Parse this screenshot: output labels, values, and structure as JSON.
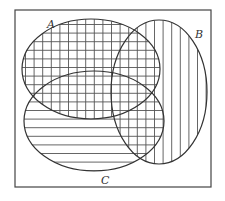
{
  "diagram": {
    "type": "venn",
    "sets": [
      {
        "name": "A",
        "label": "A",
        "fill_pattern": "grid (vertical + horizontal hatching)",
        "label_pos": [
          47,
          28
        ]
      },
      {
        "name": "B",
        "label": "B",
        "fill_pattern": "vertical hatching",
        "label_pos": [
          195,
          38
        ]
      },
      {
        "name": "C",
        "label": "C",
        "fill_pattern": "horizontal hatching",
        "label_pos": [
          101,
          184
        ]
      }
    ],
    "colors": {
      "background": "#ffffff",
      "stroke": "#333333",
      "hatch": "#555555",
      "frame": "#444444"
    }
  }
}
